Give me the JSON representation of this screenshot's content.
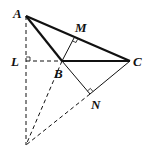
{
  "diagram": {
    "type": "geometry",
    "points": {
      "A": {
        "label": "A",
        "x": 26,
        "y": 16
      },
      "L": {
        "label": "L",
        "x": 26,
        "y": 61
      },
      "B": {
        "label": "B",
        "x": 62,
        "y": 61
      },
      "C": {
        "label": "C",
        "x": 130,
        "y": 61
      },
      "M": {
        "label": "M",
        "x": 74,
        "y": 38
      },
      "N": {
        "label": "N",
        "x": 90,
        "y": 94
      },
      "P": {
        "label": "",
        "x": 26,
        "y": 145
      }
    },
    "labels": {
      "A": "A",
      "L": "L",
      "B": "B",
      "C": "C",
      "M": "M",
      "N": "N"
    },
    "segments": [
      {
        "from": "A",
        "to": "C",
        "style": "solid-thick"
      },
      {
        "from": "A",
        "to": "B",
        "style": "solid-thick"
      },
      {
        "from": "B",
        "to": "C",
        "style": "solid-thick"
      },
      {
        "from": "B",
        "to": "M",
        "style": "solid-thin"
      },
      {
        "from": "B",
        "to": "N",
        "style": "solid-thin"
      },
      {
        "from": "C",
        "to": "N",
        "style": "solid-thin"
      },
      {
        "from": "L",
        "to": "B",
        "style": "dashed"
      },
      {
        "from": "A",
        "to": "P",
        "style": "dashed"
      },
      {
        "from": "B",
        "to": "P",
        "style": "dashed"
      },
      {
        "from": "N",
        "to": "P",
        "style": "dashed"
      }
    ],
    "right_angles": [
      "L",
      "M",
      "N"
    ]
  }
}
